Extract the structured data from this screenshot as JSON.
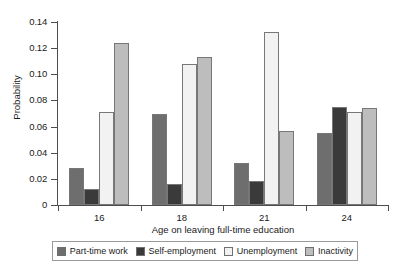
{
  "chart_data": {
    "type": "bar",
    "title": "",
    "xlabel": "Age on leaving full-time education",
    "ylabel": "Probability",
    "categories": [
      "16",
      "18",
      "21",
      "24"
    ],
    "ylim": [
      0,
      0.14
    ],
    "yticks": [
      0,
      0.02,
      0.04,
      0.06,
      0.08,
      0.1,
      0.12,
      0.14
    ],
    "ytick_labels": [
      "0",
      "0.02",
      "0.04",
      "0.06",
      "0.08",
      "0.10",
      "0.12",
      "0.14"
    ],
    "grid": false,
    "legend_position": "bottom",
    "series": [
      {
        "name": "Part-time work",
        "color": "#6e6e6e",
        "values": [
          0.028,
          0.07,
          0.032,
          0.055
        ]
      },
      {
        "name": "Self-employment",
        "color": "#3a3a3a",
        "values": [
          0.012,
          0.016,
          0.018,
          0.075
        ]
      },
      {
        "name": "Unemployment",
        "color": "#f2f2f2",
        "values": [
          0.071,
          0.108,
          0.132,
          0.071
        ]
      },
      {
        "name": "Inactivity",
        "color": "#bdbdbd",
        "values": [
          0.124,
          0.113,
          0.057,
          0.074
        ]
      }
    ]
  }
}
